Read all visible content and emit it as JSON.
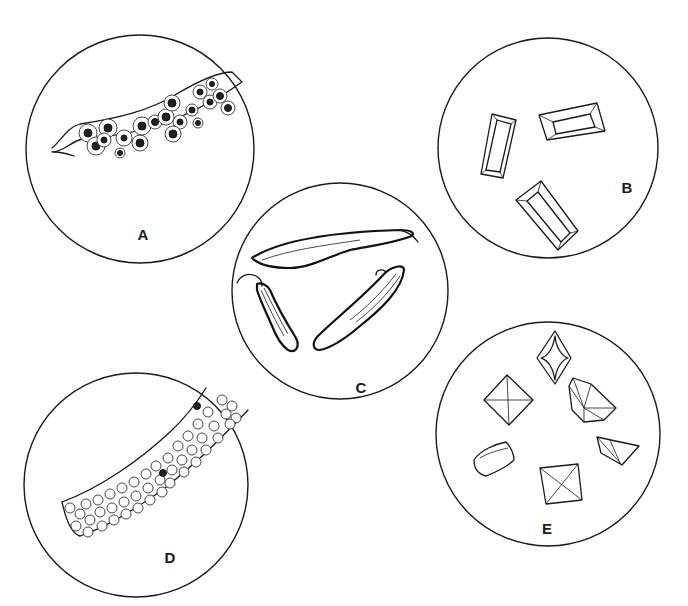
{
  "figure": {
    "panels": [
      {
        "id": "A",
        "label": "A",
        "subject": "cast with nucleated cells",
        "center": [
          140,
          149
        ],
        "radius": 114
      },
      {
        "id": "B",
        "label": "B",
        "subject": "rectangular prism crystals",
        "center": [
          548,
          148
        ],
        "radius": 110
      },
      {
        "id": "C",
        "label": "C",
        "subject": "elongated curved crystals / fibers",
        "center": [
          340,
          291
        ],
        "radius": 108
      },
      {
        "id": "D",
        "label": "D",
        "subject": "cast packed with round cells",
        "center": [
          136,
          485
        ],
        "radius": 112
      },
      {
        "id": "E",
        "label": "E",
        "subject": "octahedral / envelope crystals",
        "center": [
          548,
          434
        ],
        "radius": 112
      }
    ],
    "colors": {
      "background": "#ffffff",
      "ink": "#1a1a1a"
    }
  }
}
